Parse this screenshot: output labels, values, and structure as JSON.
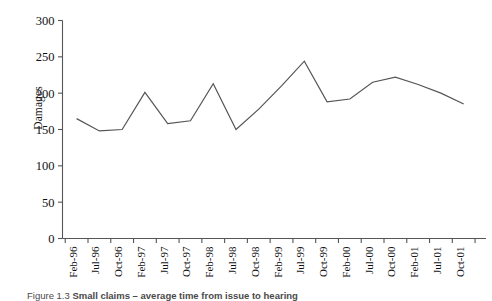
{
  "chart_data": {
    "type": "line",
    "title": "",
    "xlabel": "",
    "ylabel": "Damages",
    "ylim": [
      0,
      300
    ],
    "yticks": [
      0,
      50,
      100,
      150,
      200,
      250,
      300
    ],
    "grid": false,
    "legend": null,
    "categories": [
      "Feb-96",
      "Jul-96",
      "Oct-96",
      "Feb-97",
      "Jul-97",
      "Oct-97",
      "Feb-98",
      "Jul-98",
      "Oct-98",
      "Feb-99",
      "Jul-99",
      "Oct-99",
      "Feb-00",
      "Jul-00",
      "Oct-00",
      "Feb-01",
      "Jul-01",
      "Oct-01"
    ],
    "values": [
      165,
      148,
      150,
      201,
      158,
      162,
      213,
      150,
      178,
      210,
      244,
      188,
      192,
      215,
      222,
      212,
      200,
      185
    ],
    "series": [
      {
        "name": "Damages",
        "values": [
          165,
          148,
          150,
          201,
          158,
          162,
          213,
          150,
          178,
          210,
          244,
          188,
          192,
          215,
          222,
          212,
          200,
          185
        ],
        "color": "#555555"
      }
    ]
  },
  "caption": {
    "number": "Figure 1.3",
    "text": "Small claims – average time from issue to hearing"
  },
  "colors": {
    "line": "#555555",
    "axis": "#555555",
    "text": "#111111"
  }
}
